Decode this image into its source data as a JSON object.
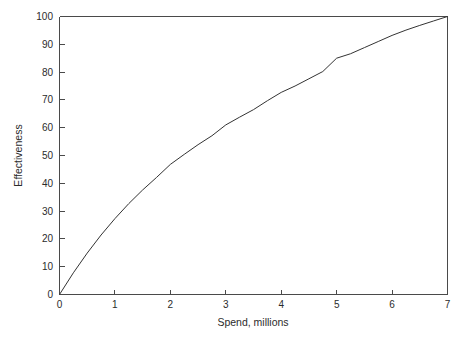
{
  "chart_data": {
    "type": "line",
    "title": "",
    "subtitle": "",
    "xlabel": "Spend, millions",
    "ylabel": "Effectiveness",
    "xlim": [
      0,
      7
    ],
    "ylim": [
      0,
      100
    ],
    "xticks": [
      "0",
      "1",
      "2",
      "3",
      "4",
      "5",
      "6",
      "7"
    ],
    "yticks": [
      "0",
      "10",
      "20",
      "30",
      "40",
      "50",
      "60",
      "70",
      "80",
      "90",
      "100"
    ],
    "grid": false,
    "legend": false,
    "legend_position": "none",
    "annotations": [],
    "line_color": "#333333",
    "series": [
      {
        "name": "Effectiveness vs Spend",
        "x": [
          0,
          0.25,
          0.5,
          0.75,
          1,
          1.25,
          1.5,
          1.75,
          2,
          2.25,
          2.5,
          2.75,
          3,
          3.25,
          3.5,
          3.75,
          4,
          4.25,
          4.5,
          4.75,
          5,
          5.25,
          5.5,
          5.75,
          6,
          6.25,
          6.5,
          6.75,
          7
        ],
        "values": [
          0,
          7.8,
          14.9,
          21.4,
          27.3,
          32.7,
          37.6,
          42.1,
          46.8,
          50.4,
          53.9,
          57.1,
          61.0,
          63.8,
          66.5,
          69.7,
          72.7,
          75.0,
          77.6,
          80.2,
          85.0,
          86.6,
          88.8,
          91.0,
          93.2,
          95.1,
          96.8,
          98.4,
          100
        ]
      }
    ]
  },
  "axes": {
    "y_axis_label": "Effectiveness",
    "x_axis_label": "Spend, millions"
  }
}
